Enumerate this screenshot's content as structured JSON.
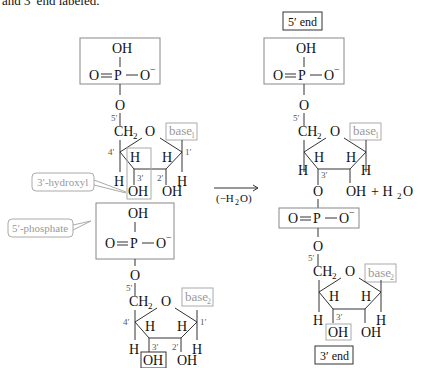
{
  "top_caption_fragment": "and 3′ end labeled.",
  "left": {
    "phosphate1": {
      "oh": "OH",
      "o_double": "O",
      "p": "P",
      "o_minus": "O",
      "charge": "−",
      "bridge_o": "O"
    },
    "sugar1": {
      "c5_label": "5′",
      "ch2": "CH",
      "ch2_sub": "2",
      "ring_o": "O",
      "base": "base",
      "base_sub": "1",
      "c4_label": "4′",
      "c1_label": "1′",
      "c3_label": "3′",
      "c2_label": "2′",
      "h": "H",
      "oh3": "OH",
      "oh2": "OH"
    },
    "callout_hydroxyl": "3′-hydroxyl",
    "callout_phosphate": "5′-phosphate",
    "phosphate2": {
      "oh": "OH",
      "o_double": "O",
      "p": "P",
      "o_minus": "O",
      "charge": "−",
      "bridge_o": "O"
    },
    "sugar2": {
      "c5_label": "5′",
      "ch2": "CH",
      "ch2_sub": "2",
      "ring_o": "O",
      "base": "base",
      "base_sub": "2",
      "c4_label": "4′",
      "c1_label": "1′",
      "c3_label": "3′",
      "c2_label": "2′",
      "h": "H",
      "oh3": "OH",
      "oh2": "OH"
    }
  },
  "reaction": {
    "arrow_label": "(−H",
    "arrow_label_sub": "2",
    "arrow_label_end": "O)",
    "plus_water": "+ H",
    "water_sub": "2",
    "water_end": "O"
  },
  "right": {
    "five_end": "5′ end",
    "three_end": "3′ end",
    "phosphate1": {
      "oh": "OH",
      "o_double": "O",
      "p": "P",
      "o_minus": "O",
      "charge": "−",
      "bridge_o": "O"
    },
    "sugar1": {
      "c5_label": "5′",
      "ch2": "CH",
      "ch2_sub": "2",
      "ring_o": "O",
      "base": "base",
      "base_sub": "1",
      "c3_label": "3′",
      "h": "H",
      "o3": "O",
      "oh2": "OH"
    },
    "linkage": {
      "o_double": "O",
      "p": "P",
      "o_minus": "O",
      "charge": "−",
      "bridge_o": "O"
    },
    "sugar2": {
      "c5_label": "5′",
      "ch2": "CH",
      "ch2_sub": "2",
      "ring_o": "O",
      "base": "base",
      "base_sub": "2",
      "c3_label": "3′",
      "h": "H",
      "oh3": "OH",
      "oh2": "OH"
    }
  }
}
